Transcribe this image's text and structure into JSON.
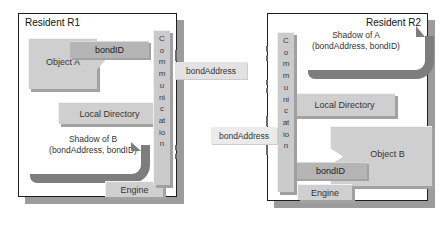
{
  "r1": {
    "title": "Resident R1",
    "object_label": "Object A",
    "bond_id": "bondID",
    "local_directory": "Local Directory",
    "shadow_line1": "Shadow of B",
    "shadow_line2": "(bondAddress, bondID)",
    "engine": "Engine",
    "communication": "Communication"
  },
  "r2": {
    "title": "Resident R2",
    "object_label": "Object B",
    "bond_id": "bondID",
    "local_directory": "Local Directory",
    "shadow_line1": "Shadow of A",
    "shadow_line2": "(bondAddress, bondID)",
    "engine": "Engine",
    "communication": "Communication"
  },
  "links": {
    "bond_address_top": "bondAddress",
    "bond_address_bottom": "bondAddress"
  },
  "colors": {
    "box_fill": "#cfcfcf",
    "tab_fill": "#b5b5b5",
    "label_fill": "#e2e2e2",
    "swoosh": "#7d7d7d",
    "drop_shadow": "#9c9c9c",
    "border": "#1f1f1f"
  }
}
